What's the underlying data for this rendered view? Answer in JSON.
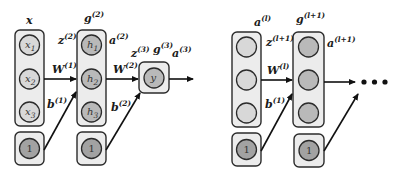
{
  "diagram": {
    "type": "neural-network-layers",
    "colors": {
      "box_fill": "#ececec",
      "input_node": "#d8d8d8",
      "hidden_node": "#b9b9b9",
      "bias_node": "#a2a2a2",
      "stroke": "#2b2b2b"
    },
    "left_network": {
      "input_layer": {
        "label": "x",
        "nodes": [
          {
            "base": "x",
            "sub": "1"
          },
          {
            "base": "x",
            "sub": "2"
          },
          {
            "base": "x",
            "sub": "3"
          }
        ],
        "bias_value": "1"
      },
      "hidden_layer": {
        "activation": {
          "base": "g",
          "sup": "(2)"
        },
        "preactivation": {
          "base": "z",
          "sup": "(2)"
        },
        "output": {
          "base": "a",
          "sup": "(2)"
        },
        "nodes": [
          {
            "base": "h",
            "sub": "1"
          },
          {
            "base": "h",
            "sub": "2"
          },
          {
            "base": "h",
            "sub": "3"
          }
        ],
        "bias_value": "1"
      },
      "weights_1": {
        "base": "W",
        "sup": "(1)"
      },
      "bias_1": {
        "base": "b",
        "sup": "(1)"
      },
      "weights_2": {
        "base": "W",
        "sup": "(2)"
      },
      "bias_2": {
        "base": "b",
        "sup": "(2)"
      },
      "output_layer": {
        "node": "y",
        "activation": {
          "base": "g",
          "sup": "(3)"
        },
        "preactivation": {
          "base": "z",
          "sup": "(3)"
        },
        "output": {
          "base": "a",
          "sup": "(3)"
        }
      }
    },
    "right_network": {
      "layer_l": {
        "label": {
          "base": "a",
          "sup": "(l)"
        },
        "bias_value": "1"
      },
      "layer_l1": {
        "activation": {
          "base": "g",
          "sup": "(l+1)"
        },
        "preactivation": {
          "base": "z",
          "sup": "(l+1)"
        },
        "output": {
          "base": "a",
          "sup": "(l+1)"
        },
        "bias_value": "1"
      },
      "weights": {
        "base": "W",
        "sup": "(l)"
      },
      "bias": {
        "base": "b",
        "sup": "(1)"
      },
      "continuation": "•••"
    }
  }
}
